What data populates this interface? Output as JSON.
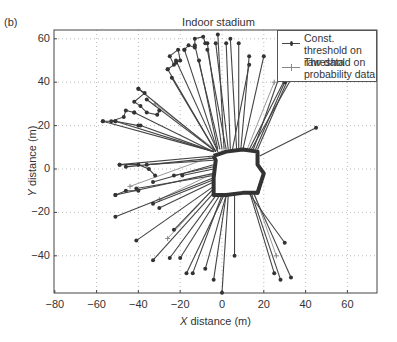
{
  "panel_tag": "(b)",
  "chart_data": {
    "type": "line",
    "title": "Indoor stadium",
    "xlabel_italic": "X",
    "xlabel_rest": " distance (m)",
    "ylabel_italic": "Y",
    "ylabel_rest": " distance (m)",
    "xlim": [
      -80,
      72
    ],
    "ylim": [
      -57,
      64
    ],
    "xticks": [
      -80,
      -60,
      -40,
      -20,
      0,
      20,
      40,
      60
    ],
    "yticks": [
      -40,
      -20,
      0,
      20,
      40,
      60
    ],
    "grid": true,
    "legend_position": "upper right",
    "series": [
      {
        "name": "Const. threshold on raw data",
        "marker": "dot",
        "color": "#444444"
      },
      {
        "name": "Threshold on probability data",
        "marker": "plus",
        "color": "#888888"
      }
    ],
    "room_outline": [
      [
        -4,
        6
      ],
      [
        2,
        8
      ],
      [
        10,
        9
      ],
      [
        17,
        8
      ],
      [
        17,
        2
      ],
      [
        20,
        -2
      ],
      [
        18,
        -8
      ],
      [
        17,
        -11
      ],
      [
        10,
        -11
      ],
      [
        2,
        -12
      ],
      [
        -4,
        -12
      ],
      [
        -4,
        -4
      ],
      [
        -3,
        4
      ],
      [
        -4,
        6
      ]
    ],
    "rays_origin_note": "rays emanate from room perimeter outward",
    "rays": [
      [
        [
          -4,
          8
        ],
        [
          -57,
          22
        ]
      ],
      [
        [
          -4,
          8
        ],
        [
          -51,
          22
        ]
      ],
      [
        [
          -4,
          8
        ],
        [
          -39,
          20
        ]
      ],
      [
        [
          -4,
          6
        ],
        [
          -49,
          2
        ]
      ],
      [
        [
          -4,
          5
        ],
        [
          -46,
          1
        ]
      ],
      [
        [
          -4,
          4
        ],
        [
          -36,
          2
        ]
      ],
      [
        [
          -4,
          2
        ],
        [
          -33,
          -6
        ]
      ],
      [
        [
          -4,
          1
        ],
        [
          -23,
          -3
        ]
      ],
      [
        [
          -4,
          0
        ],
        [
          -19,
          -3
        ]
      ],
      [
        [
          -4,
          -2
        ],
        [
          -51,
          -12
        ]
      ],
      [
        [
          -4,
          -3
        ],
        [
          -41,
          -9
        ]
      ],
      [
        [
          -4,
          -4
        ],
        [
          -51,
          -22
        ]
      ],
      [
        [
          -4,
          -5
        ],
        [
          -33,
          -16
        ]
      ],
      [
        [
          -4,
          -6
        ],
        [
          -30,
          -18
        ]
      ],
      [
        [
          -4,
          -8
        ],
        [
          -41,
          -33
        ]
      ],
      [
        [
          -4,
          -9
        ],
        [
          -23,
          -28
        ]
      ],
      [
        [
          -3,
          -10
        ],
        [
          -33,
          -42
        ]
      ],
      [
        [
          -2,
          -11
        ],
        [
          -25,
          -41
        ]
      ],
      [
        [
          -1,
          -12
        ],
        [
          -20,
          -41
        ]
      ],
      [
        [
          0,
          -12
        ],
        [
          -14,
          -48
        ]
      ],
      [
        [
          1,
          -12
        ],
        [
          -17,
          -48
        ]
      ],
      [
        [
          2,
          -12
        ],
        [
          -8,
          -46
        ]
      ],
      [
        [
          2,
          -12
        ],
        [
          -4,
          -51
        ]
      ],
      [
        [
          3,
          -12
        ],
        [
          0,
          -57
        ]
      ],
      [
        [
          6,
          -12
        ],
        [
          6,
          -40
        ]
      ],
      [
        [
          12,
          -10
        ],
        [
          30,
          -34
        ]
      ],
      [
        [
          13,
          -10
        ],
        [
          25,
          -48
        ]
      ],
      [
        [
          14,
          -11
        ],
        [
          28,
          -51
        ]
      ],
      [
        [
          15,
          -11
        ],
        [
          33,
          -50
        ]
      ],
      [
        [
          18,
          -6
        ],
        [
          17,
          -11
        ]
      ],
      [
        [
          18,
          6
        ],
        [
          45,
          19
        ]
      ],
      [
        [
          17,
          9
        ],
        [
          35,
          49
        ]
      ],
      [
        [
          16,
          9
        ],
        [
          30,
          40
        ]
      ],
      [
        [
          15,
          9
        ],
        [
          28,
          44
        ]
      ],
      [
        [
          14,
          9
        ],
        [
          41,
          55
        ]
      ],
      [
        [
          13,
          9
        ],
        [
          40,
          60
        ]
      ],
      [
        [
          10,
          9
        ],
        [
          20,
          52
        ]
      ],
      [
        [
          9,
          9
        ],
        [
          13,
          52
        ]
      ],
      [
        [
          8,
          9
        ],
        [
          8,
          58
        ]
      ],
      [
        [
          7,
          9
        ],
        [
          4,
          60
        ]
      ],
      [
        [
          5,
          9
        ],
        [
          13,
          48
        ]
      ],
      [
        [
          4,
          9
        ],
        [
          2,
          58
        ]
      ],
      [
        [
          3,
          9
        ],
        [
          -3,
          58
        ]
      ],
      [
        [
          2,
          9
        ],
        [
          -7,
          55
        ]
      ],
      [
        [
          1,
          9
        ],
        [
          -2,
          62
        ]
      ],
      [
        [
          0,
          9
        ],
        [
          -7,
          58
        ]
      ],
      [
        [
          -1,
          9
        ],
        [
          -13,
          57
        ]
      ],
      [
        [
          -2,
          9
        ],
        [
          -11,
          50
        ]
      ],
      [
        [
          -2,
          8
        ],
        [
          -18,
          55
        ]
      ],
      [
        [
          -2,
          8
        ],
        [
          -22,
          50
        ]
      ],
      [
        [
          -3,
          8
        ],
        [
          -26,
          46
        ]
      ],
      [
        [
          -3,
          8
        ],
        [
          -24,
          42
        ]
      ],
      [
        [
          -3,
          8
        ],
        [
          -40,
          37
        ]
      ],
      [
        [
          -3,
          8
        ],
        [
          -36,
          32
        ]
      ],
      [
        [
          -4,
          8
        ],
        [
          -42,
          26
        ]
      ]
    ],
    "zigzags": [
      [
        [
          -40,
          37
        ],
        [
          -37,
          35
        ],
        [
          -42,
          31
        ],
        [
          -39,
          29
        ],
        [
          -36,
          26
        ],
        [
          -31,
          25
        ],
        [
          -30,
          27
        ]
      ],
      [
        [
          -26,
          46
        ],
        [
          -23,
          48
        ],
        [
          -25,
          52
        ],
        [
          -21,
          55
        ],
        [
          -20,
          50
        ],
        [
          -22,
          49
        ]
      ],
      [
        [
          -18,
          55
        ],
        [
          -16,
          57
        ],
        [
          -13,
          56
        ],
        [
          -13,
          60
        ],
        [
          -9,
          61
        ],
        [
          -8,
          58
        ]
      ],
      [
        [
          -42,
          26
        ],
        [
          -46,
          27
        ],
        [
          -47,
          24
        ],
        [
          -53,
          22
        ]
      ],
      [
        [
          -57,
          22
        ],
        [
          -51,
          22
        ],
        [
          -40,
          20
        ]
      ],
      [
        [
          -49,
          2
        ],
        [
          -40,
          2
        ],
        [
          -35,
          0
        ],
        [
          -32,
          -3
        ]
      ],
      [
        [
          -51,
          -12
        ],
        [
          -46,
          -10
        ],
        [
          -40,
          -10
        ]
      ]
    ],
    "prob_rays": [
      [
        [
          -4,
          6
        ],
        [
          -44,
          -8
        ]
      ],
      [
        [
          -4,
          -2
        ],
        [
          -30,
          -14
        ]
      ],
      [
        [
          12,
          9
        ],
        [
          25,
          40
        ]
      ],
      [
        [
          -2,
          8
        ],
        [
          -32,
          30
        ]
      ],
      [
        [
          15,
          -10
        ],
        [
          26,
          -40
        ]
      ],
      [
        [
          -3,
          -8
        ],
        [
          -26,
          -32
        ]
      ]
    ]
  }
}
